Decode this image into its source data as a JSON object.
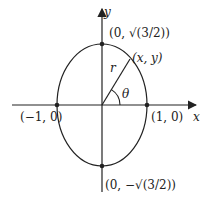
{
  "diagram": {
    "axes": {
      "x_label": "x",
      "y_label": "y"
    },
    "points": {
      "top": "(0, √(3/2))",
      "bottom": "(0, −√(3/2))",
      "left": "(−1, 0)",
      "right": "(1, 0)",
      "general": "(x, y)"
    },
    "labels": {
      "radius": "r",
      "angle": "θ"
    },
    "colors": {
      "stroke": "#222222",
      "background": "#ffffff"
    }
  }
}
